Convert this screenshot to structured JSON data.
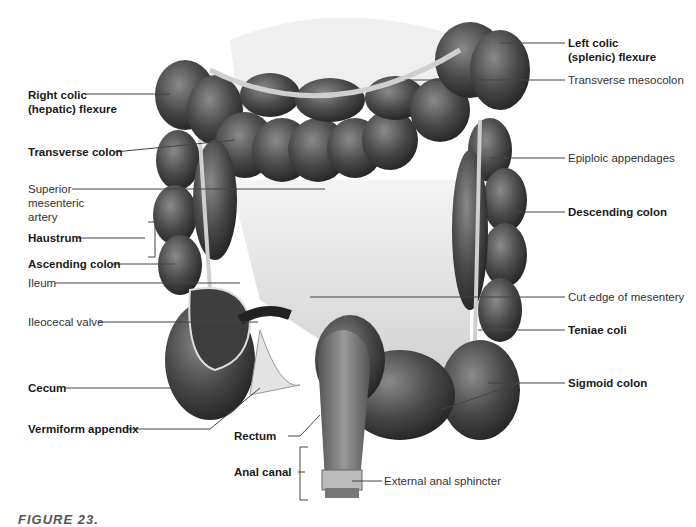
{
  "diagram": {
    "labels_left": [
      {
        "text": "Right colic\n(hepatic) flexure",
        "line1": "Right colic",
        "line2": "(hepatic) flexure",
        "bold": true
      },
      {
        "text": "Transverse colon",
        "bold": true
      },
      {
        "text": "Superior mesenteric artery",
        "line1": "Superior",
        "line2": "mesenteric",
        "line3": "artery",
        "bold": false
      },
      {
        "text": "Haustrum",
        "bold": true
      },
      {
        "text": "Ascending colon",
        "bold": true
      },
      {
        "text": "Ileum",
        "bold": false
      },
      {
        "text": "Ileocecal valve",
        "bold": false
      },
      {
        "text": "Cecum",
        "bold": true
      },
      {
        "text": "Vermiform appendix",
        "bold": true
      }
    ],
    "labels_center": [
      {
        "text": "Rectum",
        "bold": true
      },
      {
        "text": "Anal canal",
        "bold": true
      },
      {
        "text": "External anal sphincter",
        "bold": false
      }
    ],
    "labels_right": [
      {
        "text": "Left colic\n(splenic) flexure",
        "line1": "Left colic",
        "line2": "(splenic) flexure",
        "bold": true
      },
      {
        "text": "Transverse mesocolon",
        "bold": false
      },
      {
        "text": "Epiploic appendages",
        "bold": false
      },
      {
        "text": "Descending colon",
        "bold": true
      },
      {
        "text": "Cut edge of mesentery",
        "bold": false
      },
      {
        "text": "Teniae coli",
        "bold": true
      },
      {
        "text": "Sigmoid colon",
        "bold": true
      }
    ],
    "caption": {
      "prefix": "FIGURE 23.",
      "rest": "The large intestine"
    },
    "colors": {
      "tissue_dark": "#3a3a3a",
      "tissue_mid": "#6b6b6b",
      "tissue_light": "#9a9a9a",
      "mesentery": "#d8d8d8",
      "leader_line": "#444444"
    }
  }
}
